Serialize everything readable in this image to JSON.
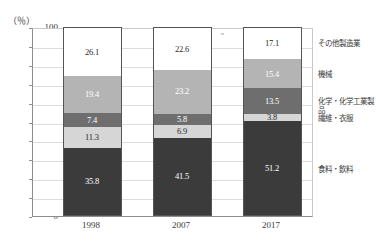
{
  "title_faint": "",
  "axis": {
    "unit_label": "（％）",
    "y_ticks": [
      0,
      10,
      20,
      30,
      40,
      50,
      60,
      70,
      80,
      90,
      100
    ],
    "x_ticks": [
      "1998",
      "2007",
      "2017"
    ]
  },
  "colors": {
    "series_food": "#3b3b3b",
    "series_textile": "#d6d6d6",
    "series_chem": "#6e6e6e",
    "series_machine": "#b4b4b4",
    "series_other": "#ffffff",
    "axis": "#8d8d8d",
    "grid": "#dcdcdc",
    "text": "#3a3a3a"
  },
  "legend": {
    "items": [
      {
        "label": "その他製造業",
        "key": "series_other"
      },
      {
        "label": "機械",
        "key": "series_machine"
      },
      {
        "label": "化学・化学工業製品",
        "key": "series_chem"
      },
      {
        "label": "繊維・衣服",
        "key": "series_textile"
      },
      {
        "label": "食料・飲料",
        "key": "series_food"
      }
    ]
  },
  "chart_data": {
    "type": "bar",
    "subtype": "stacked-100-percent",
    "title": "",
    "xlabel": "",
    "ylabel": "（％）",
    "ylim": [
      0,
      100
    ],
    "ytick_step": 10,
    "grid": true,
    "legend_position": "right",
    "categories": [
      "1998",
      "2007",
      "2017"
    ],
    "series": [
      {
        "name": "食料・飲料",
        "values": [
          35.8,
          41.5,
          50.2
        ]
      },
      {
        "name": "繊維・衣服",
        "values": [
          11.3,
          6.9,
          3.8
        ]
      },
      {
        "name": "化学・化学工業製品",
        "values": [
          7.4,
          5.8,
          13.5
        ]
      },
      {
        "name": "機械",
        "values": [
          19.4,
          23.2,
          15.4
        ]
      },
      {
        "name": "その他製造業",
        "values": [
          26.1,
          22.6,
          17.1
        ]
      }
    ],
    "data_labels": {
      "1998": [
        "35.8",
        "11.3",
        "7.4",
        "19.4",
        "26.1"
      ],
      "2007": [
        "41.5",
        "6.9",
        "5.8",
        "23.2",
        "22.6"
      ],
      "2017": [
        "51.2",
        "3.8",
        "13.5",
        "15.4",
        "17.1"
      ]
    }
  }
}
